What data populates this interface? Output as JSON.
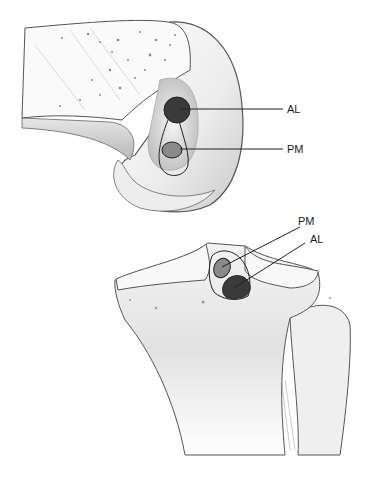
{
  "figure": {
    "panels": [
      {
        "name": "femur-lateral-view",
        "labels": {
          "al": "AL",
          "pm": "PM"
        }
      },
      {
        "name": "tibial-plateau-view",
        "labels": {
          "pm": "PM",
          "al": "AL"
        }
      }
    ],
    "colors": {
      "al_bundle": "#3a3a3a",
      "pm_bundle": "#8a8a8a",
      "outline": "#222222",
      "bone_fill": "#f2f2f2",
      "bone_shade": "#d6d6d6"
    }
  }
}
